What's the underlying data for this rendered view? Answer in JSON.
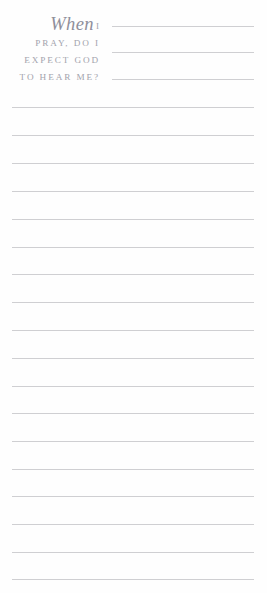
{
  "page": {
    "width": 267,
    "height": 593,
    "background_color": "#fefefe",
    "type": "lined journal prompt page"
  },
  "prompt": {
    "full_text": "When I PRAY, DO I EXPECT GOD TO HEAR ME?",
    "lines": [
      {
        "script_word": "When",
        "small_caps": "I"
      },
      {
        "text": "PRAY, DO I"
      },
      {
        "text": "EXPECT GOD"
      },
      {
        "text": "TO HEAR ME?"
      }
    ],
    "text_color": "#a3a3ad",
    "script_color": "#8f8f9b"
  },
  "ruled_lines": {
    "color": "#cfcfd2",
    "thickness_px": 1,
    "short_lines": [
      {
        "y": 26,
        "left": 112,
        "right": 254
      },
      {
        "y": 52,
        "left": 112,
        "right": 254
      },
      {
        "y": 79,
        "left": 112,
        "right": 254
      }
    ],
    "full_lines": [
      {
        "y": 107
      },
      {
        "y": 135
      },
      {
        "y": 163
      },
      {
        "y": 191
      },
      {
        "y": 219
      },
      {
        "y": 247
      },
      {
        "y": 274
      },
      {
        "y": 302
      },
      {
        "y": 330
      },
      {
        "y": 358
      },
      {
        "y": 386
      },
      {
        "y": 413
      },
      {
        "y": 441
      },
      {
        "y": 469
      },
      {
        "y": 496
      },
      {
        "y": 524
      },
      {
        "y": 552
      },
      {
        "y": 579
      }
    ],
    "full_line_left": 12,
    "full_line_right": 254
  }
}
